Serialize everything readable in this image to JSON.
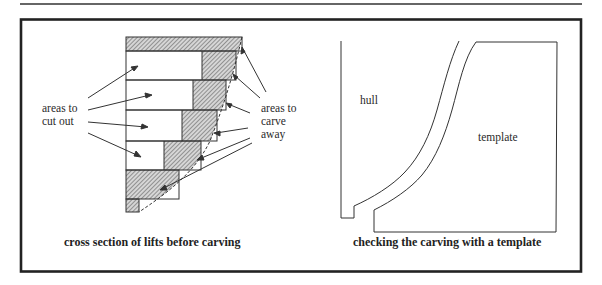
{
  "colors": {
    "background": "#ffffff",
    "ink": "#2a2a2a",
    "hatch_fill": "#b8b8b8"
  },
  "left_figure": {
    "caption": "cross section of lifts before carving",
    "label_cut_out": "areas to\ncut out",
    "label_carve_away": "areas to\ncarve\naway",
    "lifts": [
      {
        "x": 126,
        "y": 37,
        "w": 116,
        "h": 14,
        "hatch_from": 126
      },
      {
        "x": 126,
        "y": 51,
        "w": 110,
        "h": 29,
        "hatch_from": 202
      },
      {
        "x": 126,
        "y": 80,
        "w": 100,
        "h": 30,
        "hatch_from": 193
      },
      {
        "x": 126,
        "y": 110,
        "w": 91,
        "h": 31,
        "hatch_from": 182
      },
      {
        "x": 126,
        "y": 141,
        "w": 75,
        "h": 29,
        "hatch_from": 164
      },
      {
        "x": 126,
        "y": 170,
        "w": 53,
        "h": 29,
        "hatch_from": 126
      },
      {
        "x": 126,
        "y": 199,
        "w": 13,
        "h": 13,
        "hatch_from": 126
      }
    ]
  },
  "right_figure": {
    "caption": "checking the carving with a template",
    "label_hull": "hull",
    "label_template": "template"
  }
}
